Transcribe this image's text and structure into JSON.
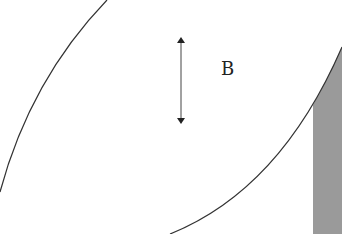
{
  "diagram": {
    "label": "B",
    "colors": {
      "stroke": "#333333",
      "fill_region": "#9a9a9a",
      "background": "#ffffff"
    }
  }
}
